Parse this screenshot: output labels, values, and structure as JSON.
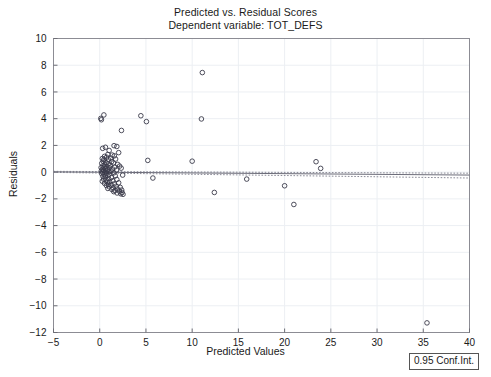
{
  "chart_data": {
    "type": "scatter",
    "title": "Predicted vs. Residual Scores",
    "subtitle": "Dependent variable: TOT_DEFS",
    "xlabel": "Predicted Values",
    "ylabel": "Residuals",
    "xlim": [
      -5,
      40
    ],
    "ylim": [
      -12,
      10
    ],
    "xticks": [
      -5,
      0,
      5,
      10,
      15,
      20,
      25,
      30,
      35,
      40
    ],
    "yticks": [
      10,
      8,
      6,
      4,
      2,
      0,
      -2,
      -4,
      -6,
      -8,
      -10,
      -12
    ],
    "grid": true,
    "legend_position": "below-right-outside",
    "legend_entries": [
      "0.95 Conf.Int."
    ],
    "marker": {
      "shape": "circle-open",
      "size": 4.6,
      "edge_color": "#3a3a4a",
      "fill": "none"
    },
    "reference_line": {
      "label": "regression line",
      "style": "solid",
      "color": "#6b6b78",
      "x": [
        -5,
        40
      ],
      "y": [
        0.02,
        -0.22
      ]
    },
    "confidence_band": {
      "label": "0.95 Conf.Int.",
      "style": "dotted",
      "color": "#8a8a96",
      "upper": {
        "x": [
          -5,
          40
        ],
        "y": [
          0.06,
          -0.08
        ]
      },
      "lower": {
        "x": [
          -5,
          40
        ],
        "y": [
          -0.02,
          -0.44
        ]
      }
    },
    "points": [
      [
        0.12,
        4.02
      ],
      [
        0.45,
        4.28
      ],
      [
        0.18,
        3.92
      ],
      [
        4.45,
        4.22
      ],
      [
        5.05,
        3.78
      ],
      [
        2.35,
        3.12
      ],
      [
        11.1,
        7.45
      ],
      [
        11.0,
        3.98
      ],
      [
        1.55,
        1.98
      ],
      [
        1.85,
        1.92
      ],
      [
        0.62,
        1.86
      ],
      [
        0.32,
        1.78
      ],
      [
        1.02,
        1.62
      ],
      [
        2.05,
        1.46
      ],
      [
        0.88,
        1.32
      ],
      [
        1.35,
        1.28
      ],
      [
        1.58,
        1.22
      ],
      [
        0.52,
        1.18
      ],
      [
        0.75,
        1.12
      ],
      [
        1.18,
        1.05
      ],
      [
        0.28,
        1.02
      ],
      [
        1.72,
        0.98
      ],
      [
        0.45,
        0.95
      ],
      [
        0.95,
        0.92
      ],
      [
        5.2,
        0.88
      ],
      [
        10.0,
        0.82
      ],
      [
        23.4,
        0.78
      ],
      [
        0.38,
        0.82
      ],
      [
        1.28,
        0.78
      ],
      [
        0.68,
        0.72
      ],
      [
        1.48,
        0.68
      ],
      [
        0.22,
        0.66
      ],
      [
        0.92,
        0.62
      ],
      [
        1.95,
        0.58
      ],
      [
        0.55,
        0.55
      ],
      [
        1.12,
        0.52
      ],
      [
        0.35,
        0.48
      ],
      [
        2.15,
        0.45
      ],
      [
        0.78,
        0.42
      ],
      [
        1.62,
        0.38
      ],
      [
        0.48,
        0.36
      ],
      [
        0.15,
        0.34
      ],
      [
        1.05,
        0.32
      ],
      [
        2.32,
        0.3
      ],
      [
        23.9,
        0.28
      ],
      [
        0.65,
        0.26
      ],
      [
        1.38,
        0.24
      ],
      [
        0.28,
        0.22
      ],
      [
        0.85,
        0.18
      ],
      [
        1.82,
        0.16
      ],
      [
        0.42,
        0.14
      ],
      [
        0.18,
        0.1
      ],
      [
        1.22,
        0.08
      ],
      [
        0.58,
        0.05
      ],
      [
        0.98,
        0.02
      ],
      [
        0.32,
        -0.02
      ],
      [
        1.55,
        -0.05
      ],
      [
        0.72,
        -0.08
      ],
      [
        0.22,
        -0.12
      ],
      [
        1.05,
        -0.15
      ],
      [
        0.48,
        -0.18
      ],
      [
        2.48,
        -0.22
      ],
      [
        0.88,
        -0.25
      ],
      [
        1.68,
        -0.28
      ],
      [
        0.35,
        -0.32
      ],
      [
        0.62,
        -0.36
      ],
      [
        1.28,
        -0.4
      ],
      [
        5.75,
        -0.44
      ],
      [
        15.9,
        -0.52
      ],
      [
        0.95,
        -0.48
      ],
      [
        0.42,
        -0.52
      ],
      [
        1.85,
        -0.55
      ],
      [
        0.68,
        -0.6
      ],
      [
        1.42,
        -0.64
      ],
      [
        0.28,
        -0.68
      ],
      [
        1.08,
        -0.72
      ],
      [
        0.82,
        -0.76
      ],
      [
        2.05,
        -0.8
      ],
      [
        0.52,
        -0.84
      ],
      [
        1.58,
        -0.88
      ],
      [
        0.95,
        -0.92
      ],
      [
        20.0,
        -1.02
      ],
      [
        1.25,
        -0.96
      ],
      [
        0.72,
        -1.0
      ],
      [
        1.78,
        -1.05
      ],
      [
        1.02,
        -1.1
      ],
      [
        2.22,
        -1.14
      ],
      [
        1.45,
        -1.18
      ],
      [
        0.88,
        -1.22
      ],
      [
        1.92,
        -1.26
      ],
      [
        1.32,
        -1.3
      ],
      [
        2.38,
        -1.34
      ],
      [
        1.65,
        -1.38
      ],
      [
        2.12,
        -1.42
      ],
      [
        1.52,
        -1.46
      ],
      [
        2.42,
        -1.52
      ],
      [
        1.88,
        -1.56
      ],
      [
        2.28,
        -1.62
      ],
      [
        2.52,
        -1.66
      ],
      [
        12.4,
        -1.52
      ],
      [
        21.0,
        -2.42
      ],
      [
        35.4,
        -11.28
      ]
    ]
  }
}
